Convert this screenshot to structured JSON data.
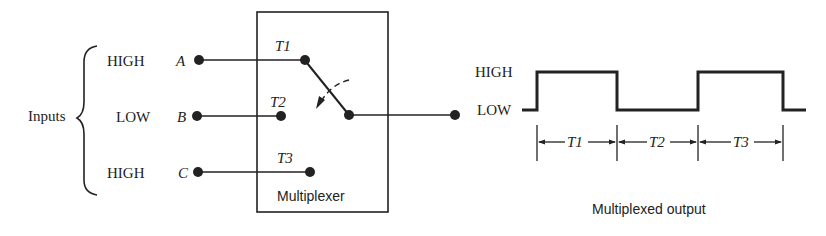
{
  "inputs": {
    "group_label": "Inputs",
    "items": [
      {
        "level": "HIGH",
        "name": "A",
        "switch_label": "T1"
      },
      {
        "level": "LOW",
        "name": "B",
        "switch_label": "T2"
      },
      {
        "level": "HIGH",
        "name": "C",
        "switch_label": "T3"
      }
    ]
  },
  "multiplexer": {
    "label": "Multiplexer"
  },
  "output": {
    "caption": "Multiplexed output",
    "high_label": "HIGH",
    "low_label": "LOW",
    "intervals": [
      "T1",
      "T2",
      "T3"
    ],
    "sequence": [
      "HIGH",
      "LOW",
      "HIGH"
    ]
  },
  "colors": {
    "ink": "#222222",
    "background": "#ffffff"
  }
}
